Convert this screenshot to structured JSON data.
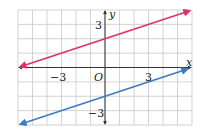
{
  "chart_data": {
    "type": "line",
    "title": "",
    "xlabel": "x",
    "ylabel": "y",
    "xlim": [
      -6,
      6
    ],
    "ylim": [
      -4,
      4
    ],
    "grid": true,
    "grid_step": 1,
    "tick_labels": {
      "x": [
        {
          "value": -3,
          "text": "−3"
        },
        {
          "value": 3,
          "text": "3"
        }
      ],
      "y": [
        {
          "value": 3,
          "text": "3"
        },
        {
          "value": -3,
          "text": "−3"
        }
      ],
      "origin": "O"
    },
    "series": [
      {
        "name": "red line",
        "color": "#e0306a",
        "equation": "y = (1/3)x + 2",
        "slope": 0.3333,
        "intercept": 2,
        "x": [
          -5.85,
          5.85
        ],
        "y": [
          0.05,
          3.95
        ],
        "arrows": "both"
      },
      {
        "name": "blue line",
        "color": "#3a7cc4",
        "equation": "y = (1/3)x - 2",
        "slope": 0.3333,
        "intercept": -2,
        "x": [
          -5.85,
          5.7
        ],
        "y": [
          -3.95,
          -0.1
        ],
        "arrows": "both"
      }
    ],
    "legend": null
  },
  "labels": {
    "x_axis": "x",
    "y_axis": "y",
    "origin": "O",
    "x_neg3": "−3",
    "x_pos3": "3",
    "y_pos3": "3",
    "y_neg3": "−3"
  },
  "colors": {
    "grid": "#c8c8c8",
    "axis": "#333333",
    "red": "#e0306a",
    "blue": "#3a7cc4"
  }
}
